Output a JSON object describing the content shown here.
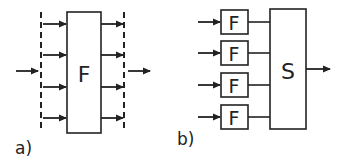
{
  "diagram_a": {
    "label": "a)",
    "block_label": "F",
    "inputs": 4,
    "outputs": 4
  },
  "diagram_b": {
    "label": "b)",
    "sub_block_label": "F",
    "sub_blocks": [
      "F",
      "F",
      "F",
      "F"
    ],
    "combiner_label": "S"
  },
  "colors": {
    "stroke": "#222222",
    "background": "#ffffff"
  }
}
